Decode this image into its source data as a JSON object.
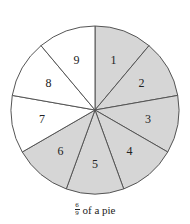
{
  "diagram": {
    "type": "fraction-pie",
    "center": [
      95,
      110
    ],
    "radius": 84,
    "total_slices": 9,
    "shaded_count": 6,
    "shaded_color": "#d6d6d6",
    "unshaded_color": "#ffffff",
    "stroke_color": "#555555",
    "slices": [
      {
        "label": "1",
        "shaded": true
      },
      {
        "label": "2",
        "shaded": true
      },
      {
        "label": "3",
        "shaded": true
      },
      {
        "label": "4",
        "shaded": true
      },
      {
        "label": "5",
        "shaded": true
      },
      {
        "label": "6",
        "shaded": true
      },
      {
        "label": "7",
        "shaded": false
      },
      {
        "label": "8",
        "shaded": false
      },
      {
        "label": "9",
        "shaded": false
      }
    ]
  },
  "caption": {
    "numerator": "6",
    "denominator": "9",
    "text": "of a pie"
  }
}
